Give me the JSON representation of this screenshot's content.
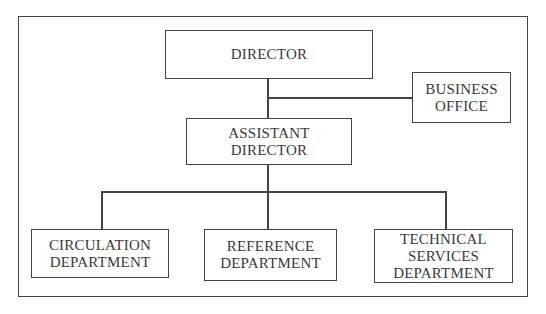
{
  "diagram": {
    "type": "organizational-chart",
    "nodes": [
      {
        "id": "director",
        "lines": [
          "DIRECTOR"
        ]
      },
      {
        "id": "business_office",
        "lines": [
          "BUSINESS",
          "OFFICE"
        ]
      },
      {
        "id": "assistant_director",
        "lines": [
          "ASSISTANT",
          "DIRECTOR"
        ]
      },
      {
        "id": "circulation",
        "lines": [
          "CIRCULATION",
          "DEPARTMENT"
        ]
      },
      {
        "id": "reference",
        "lines": [
          "REFERENCE",
          "DEPARTMENT"
        ]
      },
      {
        "id": "technical_services",
        "lines": [
          "TECHNICAL",
          "SERVICES",
          "DEPARTMENT"
        ]
      }
    ],
    "edges": [
      {
        "from": "director",
        "to": "assistant_director"
      },
      {
        "from": "director",
        "to": "business_office",
        "style": "staff"
      },
      {
        "from": "assistant_director",
        "to": "circulation"
      },
      {
        "from": "assistant_director",
        "to": "reference"
      },
      {
        "from": "assistant_director",
        "to": "technical_services"
      }
    ]
  }
}
